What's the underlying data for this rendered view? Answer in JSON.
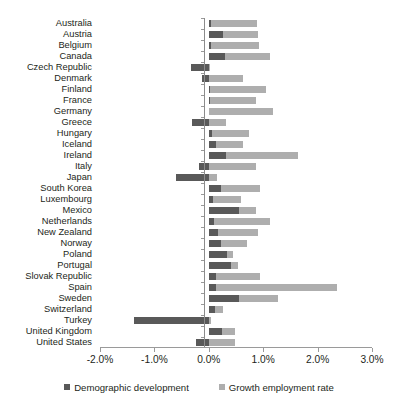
{
  "chart_data": {
    "type": "bar",
    "subtype": "horizontal-stacked-bar",
    "title": "",
    "xlabel": "",
    "ylabel": "",
    "xlim": [
      -2.0,
      3.0
    ],
    "xtick_labels": [
      "-2.0%",
      "-1.0%",
      "0.0%",
      "1.0%",
      "2.0%",
      "3.0%"
    ],
    "xticks": [
      -2.0,
      -1.0,
      0.0,
      1.0,
      2.0,
      3.0
    ],
    "grid": false,
    "legend_position": "bottom",
    "units": "percent",
    "orientation": "horizontal",
    "categories": [
      "Australia",
      "Austria",
      "Belgium",
      "Canada",
      "Czech Republic",
      "Denmark",
      "Finland",
      "France",
      "Germany",
      "Greece",
      "Hungary",
      "Iceland",
      "Ireland",
      "Italy",
      "Japan",
      "South Korea",
      "Luxembourg",
      "Mexico",
      "Netherlands",
      "New Zealand",
      "Norway",
      "Poland",
      "Portugal",
      "Slovak Republic",
      "Spain",
      "Sweden",
      "Switzerland",
      "Turkey",
      "United Kingdom",
      "United States"
    ],
    "series": [
      {
        "name": "Demographic development",
        "color": "#595959",
        "values": [
          0.04,
          0.27,
          0.04,
          0.29,
          -0.32,
          -0.12,
          0.02,
          0.03,
          0.01,
          -0.3,
          0.05,
          0.14,
          0.32,
          -0.18,
          -0.61,
          0.23,
          0.07,
          0.55,
          0.09,
          0.17,
          0.22,
          0.33,
          0.41,
          0.13,
          0.14,
          0.56,
          0.12,
          -1.38,
          0.25,
          -0.24
        ]
      },
      {
        "name": "Growth employment rate",
        "color": "#aeaeae",
        "values": [
          0.85,
          0.64,
          0.89,
          0.84,
          0.02,
          0.62,
          1.03,
          0.83,
          1.17,
          0.32,
          0.69,
          0.48,
          1.32,
          0.87,
          0.15,
          0.72,
          0.53,
          0.31,
          1.03,
          0.74,
          0.48,
          0.12,
          0.13,
          0.81,
          2.22,
          0.71,
          0.15,
          0.04,
          0.24,
          0.48
        ]
      }
    ]
  },
  "legend": {
    "items": [
      {
        "label": "Demographic development",
        "color": "#595959"
      },
      {
        "label": "Growth employment rate",
        "color": "#aeaeae"
      }
    ]
  }
}
